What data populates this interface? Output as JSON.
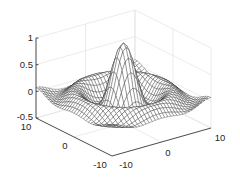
{
  "chart_data": {
    "type": "surface-mesh",
    "function": "z = sin(r)/r, r = sqrt(x^2 + y^2)",
    "title": "",
    "xlabel": "",
    "ylabel": "",
    "zlabel": "",
    "xlim": [
      -10,
      10
    ],
    "ylim": [
      -10,
      10
    ],
    "zlim": [
      -0.5,
      1
    ],
    "x_ticks": [
      "-10",
      "0",
      "10"
    ],
    "y_ticks": [
      "-10",
      "0",
      "10"
    ],
    "z_ticks": [
      "-0.5",
      "0",
      "0.5",
      "1"
    ],
    "grid": true,
    "box": false,
    "peak": {
      "x": 0,
      "y": 0,
      "z": 1
    },
    "mesh_resolution": 33,
    "colors": {
      "mesh_line": "#2a2a2a",
      "mesh_face": "#ffffff",
      "axis": "#262626",
      "grid": "#e3e3e3"
    }
  },
  "axes": {
    "z_ticks": [
      {
        "label": "1",
        "value": 1
      },
      {
        "label": "0.5",
        "value": 0.5
      },
      {
        "label": "0",
        "value": 0
      },
      {
        "label": "-0.5",
        "value": -0.5
      }
    ],
    "y_ticks": [
      {
        "label": "10",
        "value": 10
      },
      {
        "label": "0",
        "value": 0
      },
      {
        "label": "-10",
        "value": -10
      }
    ],
    "x_ticks": [
      {
        "label": "-10",
        "value": -10
      },
      {
        "label": "0",
        "value": 0
      },
      {
        "label": "10",
        "value": 10
      }
    ]
  }
}
